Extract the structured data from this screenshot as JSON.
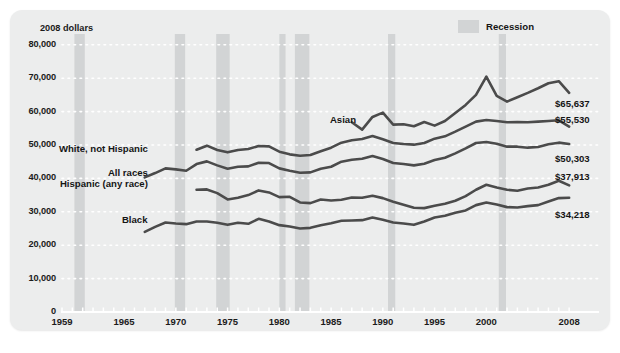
{
  "chart_data": {
    "type": "line",
    "title": "",
    "subtitle": "",
    "units_label": "2008 dollars",
    "xlabel": "",
    "ylabel": "",
    "xlim": [
      1959,
      2008
    ],
    "ylim": [
      0,
      80000
    ],
    "grid": "dotted-horizontal",
    "legend_position": "top-right",
    "y_ticks": [
      "0",
      "10,000",
      "20,000",
      "30,000",
      "40,000",
      "50,000",
      "60,000",
      "70,000",
      "80,000"
    ],
    "y_tick_values": [
      0,
      10000,
      20000,
      30000,
      40000,
      50000,
      60000,
      70000,
      80000
    ],
    "x_ticks": [
      "1959",
      "1965",
      "1970",
      "1975",
      "1980",
      "1985",
      "1990",
      "1995",
      "2000",
      "2008"
    ],
    "x_tick_values": [
      1959,
      1965,
      1970,
      1975,
      1980,
      1985,
      1990,
      1995,
      2000,
      2008
    ],
    "line_color": "#4b4b4b",
    "recession_color": "#d2d4d5",
    "background_color": "#eceded",
    "legend": [
      {
        "label": "Recession",
        "color": "#d2d4d5",
        "kind": "band"
      }
    ],
    "recessions": [
      {
        "start": 1960.2,
        "end": 1961.2
      },
      {
        "start": 1969.9,
        "end": 1970.9
      },
      {
        "start": 1973.9,
        "end": 1975.2
      },
      {
        "start": 1980.0,
        "end": 1980.6
      },
      {
        "start": 1981.5,
        "end": 1982.9
      },
      {
        "start": 1990.5,
        "end": 1991.2
      },
      {
        "start": 2001.2,
        "end": 2001.9
      }
    ],
    "series": [
      {
        "name": "Asian",
        "end_value_label": "$65,637",
        "label_x": 1987.4,
        "label_y": 57600,
        "x": [
          1987,
          1988,
          1989,
          1990,
          1991,
          1992,
          1993,
          1994,
          1995,
          1996,
          1997,
          1998,
          1999,
          2000,
          2001,
          2002,
          2003,
          2004,
          2005,
          2006,
          2007,
          2008
        ],
        "values": [
          56800,
          54600,
          58400,
          59700,
          56100,
          56200,
          55600,
          56900,
          55800,
          57200,
          59600,
          62000,
          65000,
          70500,
          64700,
          63000,
          64300,
          65600,
          67000,
          68500,
          69100,
          65637
        ]
      },
      {
        "name": "White, not Hispanic",
        "end_value_label": "$55,530",
        "label_x": 1967.3,
        "label_y": 48900,
        "x": [
          1972,
          1973,
          1974,
          1975,
          1976,
          1977,
          1978,
          1979,
          1980,
          1981,
          1982,
          1983,
          1984,
          1985,
          1986,
          1987,
          1988,
          1989,
          1990,
          1991,
          1992,
          1993,
          1994,
          1995,
          1996,
          1997,
          1998,
          1999,
          2000,
          2001,
          2002,
          2003,
          2004,
          2005,
          2006,
          2007,
          2008
        ],
        "values": [
          48600,
          49800,
          48500,
          47800,
          48500,
          48800,
          49700,
          49600,
          48000,
          47200,
          46800,
          47000,
          48100,
          49200,
          50700,
          51400,
          51800,
          52700,
          51700,
          50600,
          50300,
          50100,
          50600,
          51900,
          52600,
          54000,
          55500,
          57000,
          57500,
          57200,
          56800,
          56900,
          56800,
          57000,
          57200,
          57400,
          55530
        ]
      },
      {
        "name": "All races",
        "end_value_label": "$50,303",
        "label_x": 1967.3,
        "label_y": 41600,
        "x": [
          1967,
          1968,
          1969,
          1970,
          1971,
          1972,
          1973,
          1974,
          1975,
          1976,
          1977,
          1978,
          1979,
          1980,
          1981,
          1982,
          1983,
          1984,
          1985,
          1986,
          1987,
          1988,
          1989,
          1990,
          1991,
          1992,
          1993,
          1994,
          1995,
          1996,
          1997,
          1998,
          1999,
          2000,
          2001,
          2002,
          2003,
          2004,
          2005,
          2006,
          2007,
          2008
        ],
        "values": [
          40300,
          41600,
          43000,
          42700,
          42300,
          44300,
          45100,
          43900,
          42900,
          43500,
          43600,
          44700,
          44600,
          43000,
          42300,
          41700,
          41800,
          42900,
          43500,
          45000,
          45600,
          45900,
          46700,
          45800,
          44600,
          44300,
          43900,
          44400,
          45500,
          46200,
          47500,
          49000,
          50600,
          50900,
          50400,
          49500,
          49500,
          49200,
          49400,
          50200,
          50700,
          50303
        ]
      },
      {
        "name": "Hispanic (any race)",
        "end_value_label": "$37,913",
        "label_x": 1967.3,
        "label_y": 38200,
        "x": [
          1972,
          1973,
          1974,
          1975,
          1976,
          1977,
          1978,
          1979,
          1980,
          1981,
          1982,
          1983,
          1984,
          1985,
          1986,
          1987,
          1988,
          1989,
          1990,
          1991,
          1992,
          1993,
          1994,
          1995,
          1996,
          1997,
          1998,
          1999,
          2000,
          2001,
          2002,
          2003,
          2004,
          2005,
          2006,
          2007,
          2008
        ],
        "values": [
          36600,
          36700,
          35600,
          33700,
          34200,
          35000,
          36400,
          35800,
          34400,
          34500,
          32800,
          32600,
          33700,
          33400,
          33600,
          34300,
          34200,
          34800,
          34100,
          33000,
          32100,
          31200,
          31100,
          31800,
          32400,
          33300,
          34700,
          36600,
          38100,
          37300,
          36600,
          36300,
          37000,
          37300,
          38100,
          39300,
          37913
        ]
      },
      {
        "name": "Black",
        "end_value_label": "$34,218",
        "label_x": 1967.3,
        "label_y": 27400,
        "x": [
          1967,
          1968,
          1969,
          1970,
          1971,
          1972,
          1973,
          1974,
          1975,
          1976,
          1977,
          1978,
          1979,
          1980,
          1981,
          1982,
          1983,
          1984,
          1985,
          1986,
          1987,
          1988,
          1989,
          1990,
          1991,
          1992,
          1993,
          1994,
          1995,
          1996,
          1997,
          1998,
          1999,
          2000,
          2001,
          2002,
          2003,
          2004,
          2005,
          2006,
          2007,
          2008
        ],
        "values": [
          24000,
          25500,
          26800,
          26500,
          26300,
          27100,
          27100,
          26700,
          26100,
          26700,
          26400,
          27900,
          27100,
          26000,
          25600,
          25000,
          25200,
          26000,
          26600,
          27300,
          27400,
          27500,
          28300,
          27600,
          26800,
          26500,
          26100,
          27100,
          28300,
          28800,
          29700,
          30400,
          32000,
          32800,
          32200,
          31400,
          31300,
          31700,
          32000,
          33100,
          34100,
          34218
        ]
      }
    ]
  }
}
